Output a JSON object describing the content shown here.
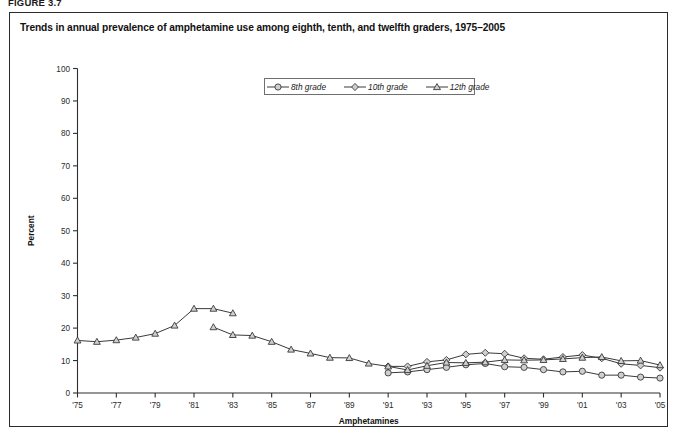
{
  "figure": {
    "label": "FIGURE 3.7",
    "title": "Trends in annual prevalence of amphetamine use among eighth, tenth, and twelfth graders, 1975–2005"
  },
  "legend": {
    "position": "top-center",
    "items": [
      {
        "label": "8th grade",
        "marker": "circle"
      },
      {
        "label": "10th grade",
        "marker": "diamond"
      },
      {
        "label": "12th grade",
        "marker": "triangle"
      }
    ]
  },
  "chart_data": {
    "type": "line",
    "title": "Trends in annual prevalence of amphetamine use among eighth, tenth, and twelfth graders, 1975–2005",
    "xlabel": "Amphetamines",
    "ylabel": "Percent",
    "ylim": [
      0,
      100
    ],
    "ytick_step": 10,
    "yticks": [
      0,
      10,
      20,
      30,
      40,
      50,
      60,
      70,
      80,
      90,
      100
    ],
    "xlim": [
      1975,
      2005
    ],
    "xticks": [
      1975,
      1977,
      1979,
      1981,
      1983,
      1985,
      1987,
      1989,
      1991,
      1993,
      1995,
      1997,
      1999,
      2001,
      2003,
      2005
    ],
    "xtick_labels": [
      "'75",
      "'77",
      "'79",
      "'81",
      "'83",
      "'85",
      "'87",
      "'89",
      "'91",
      "'93",
      "'95",
      "'97",
      "'99",
      "'01",
      "'03",
      "'05"
    ],
    "grid": false,
    "legend_position": "top-center",
    "series": [
      {
        "name": "8th grade",
        "marker": "circle",
        "x": [
          1991,
          1992,
          1993,
          1994,
          1995,
          1996,
          1997,
          1998,
          1999,
          2000,
          2001,
          2002,
          2003,
          2004,
          2005
        ],
        "values": [
          6.2,
          6.5,
          7.2,
          7.9,
          8.7,
          9.1,
          8.1,
          7.9,
          7.2,
          6.5,
          6.7,
          5.5,
          5.5,
          4.9,
          4.6
        ]
      },
      {
        "name": "10th grade",
        "marker": "diamond",
        "x": [
          1991,
          1992,
          1993,
          1994,
          1995,
          1996,
          1997,
          1998,
          1999,
          2000,
          2001,
          2002,
          2003,
          2004,
          2005
        ],
        "values": [
          8.2,
          8.2,
          9.6,
          10.2,
          11.9,
          12.4,
          12.1,
          10.7,
          10.4,
          11.1,
          11.7,
          10.7,
          9.0,
          8.5,
          7.8
        ]
      },
      {
        "name": "12th grade (1975–1982)",
        "marker": "triangle",
        "x": [
          1975,
          1976,
          1977,
          1978,
          1979,
          1980,
          1981,
          1982
        ],
        "values": [
          16.2,
          15.8,
          16.3,
          17.1,
          18.3,
          20.8,
          26.0,
          26.0
        ]
      },
      {
        "name": "12th grade (1982–2005, revised)",
        "marker": "triangle",
        "x": [
          1982,
          1983,
          1984,
          1985,
          1986,
          1987,
          1988,
          1989,
          1990,
          1991,
          1992,
          1993,
          1994,
          1995,
          1996,
          1997,
          1998,
          1999,
          2000,
          2001,
          2002,
          2003,
          2004,
          2005
        ],
        "values": [
          20.3,
          17.9,
          17.7,
          15.8,
          13.4,
          12.2,
          10.9,
          10.8,
          9.1,
          8.2,
          7.1,
          8.4,
          9.4,
          9.3,
          9.5,
          10.2,
          10.1,
          10.2,
          10.5,
          10.9,
          11.1,
          9.9,
          10.0,
          8.6
        ]
      },
      {
        "name": "12th grade (1983 upper)",
        "marker": "triangle",
        "x": [
          1983
        ],
        "values": [
          24.6
        ]
      }
    ]
  }
}
